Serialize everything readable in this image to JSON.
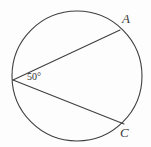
{
  "figure": {
    "type": "circle-inscribed-angle-diagram",
    "background_color": "#fdfdfd",
    "stroke_color": "#3f3f3f",
    "labels": {
      "point_a": "A",
      "point_c": "C",
      "angle_measure": "50°"
    },
    "geometry": {
      "circle": {
        "cx": 77,
        "cy": 76,
        "r": 65
      },
      "vertex": {
        "x": 13,
        "y": 80
      },
      "point_a": {
        "x": 120,
        "y": 30
      },
      "point_c": {
        "x": 124,
        "y": 124
      }
    }
  }
}
